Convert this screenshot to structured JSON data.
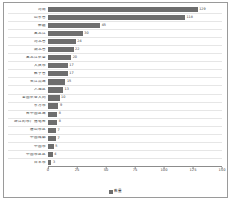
{
  "chart_data": {
    "type": "bar",
    "orientation": "horizontal",
    "title": "",
    "xlabel": "",
    "ylabel": "",
    "xlim": [
      0,
      150
    ],
    "xticks": [
      "0",
      "25",
      "50",
      "75",
      "100",
      "125",
      "150"
    ],
    "grid": true,
    "legend_position": "bottom",
    "series_name": "数量",
    "bar_color": "#6e6e6e",
    "categories": [
      "河南",
      "山东省",
      "新疆",
      "黑龙江",
      "河北省",
      "湖北省",
      "黑龙江农垦",
      "大庆市",
      "数字省",
      "长江流域",
      "入地区",
      "全国农业大同",
      "东方市",
      "台中国区域",
      "浙江的市广播电台",
      "唐山市区",
      "中国成都",
      "中国市",
      "中国市区区",
      "日本市"
    ],
    "values": [
      129,
      118,
      45,
      30,
      24,
      22,
      20,
      17,
      17,
      15,
      13,
      10,
      9,
      8,
      8,
      7,
      7,
      5,
      4,
      3
    ],
    "value_labels": [
      "129",
      "118",
      "45",
      "30",
      "24",
      "22",
      "20",
      "17",
      "17",
      "15",
      "13",
      "10",
      "9",
      "8",
      "8",
      "7",
      "7",
      "5",
      "4",
      "3"
    ]
  },
  "legend": {
    "label": "数量"
  }
}
